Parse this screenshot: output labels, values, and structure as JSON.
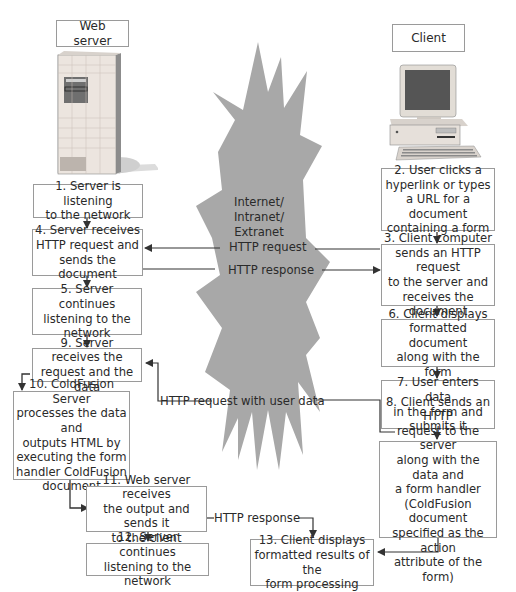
{
  "diagram": {
    "type": "flowchart",
    "colors": {
      "burst": "#a8a8a8",
      "box_border": "#9a9a9a",
      "arrow": "#333333",
      "text": "#2a2a2a"
    },
    "headers": {
      "server": "Web server",
      "client": "Client"
    },
    "network_label": "Internet/\nIntranet/\nExtranet",
    "server_steps": [
      {
        "id": 1,
        "text": "1. Server is listening\nto the network"
      },
      {
        "id": 4,
        "text": "4. Server receives\nHTTP request and\nsends the document"
      },
      {
        "id": 5,
        "text": "5. Server continues\nlistening to the\nnetwork"
      },
      {
        "id": 9,
        "text": "9. Server receives the\nrequest and the data"
      },
      {
        "id": 10,
        "text": "10. ColdFusion Server\nprocesses the data and\noutputs HTML by\nexecuting the form\nhandler ColdFusion\ndocument"
      },
      {
        "id": 11,
        "text": "11. Web server receives\nthe output and sends it\nto the client"
      },
      {
        "id": 12,
        "text": "12. Server continues\nlistening to the network"
      }
    ],
    "client_steps": [
      {
        "id": 2,
        "text": "2. User clicks a\nhyperlink or types\na URL for a document\ncontaining a form"
      },
      {
        "id": 3,
        "text": "3. Client computer\nsends an HTTP request\nto the server and\nreceives the document"
      },
      {
        "id": 6,
        "text": "6. Client displays\nformatted document\nalong with the form"
      },
      {
        "id": 7,
        "text": "7. User enters data\nin the form and\nsubmits it"
      },
      {
        "id": 8,
        "text": "8. Client sends an HTTP\nrequest to the server\nalong with the data and\na form handler\n(ColdFusion document\nspecified as the action\nattribute of the form)"
      },
      {
        "id": 13,
        "text": "13. Client displays\nformatted results of the\nform processing"
      }
    ],
    "connector_labels": {
      "http_request": "HTTP request",
      "http_response": "HTTP response",
      "http_request_with_data": "HTTP request with user data",
      "http_response_2": "HTTP response"
    }
  }
}
